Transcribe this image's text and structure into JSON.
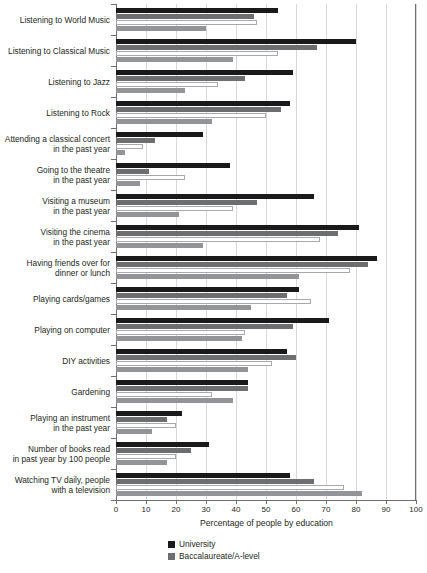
{
  "chart_data": {
    "type": "bar",
    "orientation": "horizontal",
    "title": "",
    "xlabel": "Percentage of people by education",
    "ylabel": "",
    "xlim": [
      0,
      100
    ],
    "xticks": [
      0,
      10,
      20,
      30,
      40,
      50,
      60,
      70,
      80,
      90,
      100
    ],
    "grid": true,
    "legend_position": "bottom",
    "categories": [
      "Listening to World Music",
      "Listening to Classical Music",
      "Listening to Jazz",
      "Listening to Rock",
      "Attending a classical concert\nin the past year",
      "Going to the theatre\nin the past year",
      "Visiting a museum\nin the past year",
      "Visiting the cinema\nin the past year",
      "Having friends over for\ndinner or lunch",
      "Playing cards/games",
      "Playing on computer",
      "DIY activities",
      "Gardening",
      "Playing an instrument\nin the past year",
      "Number of books read\nin past year by 100 people",
      "Watching TV daily, people\nwith a television"
    ],
    "series": [
      {
        "name": "University",
        "color": "#1a1a1a",
        "values": [
          54,
          80,
          59,
          58,
          29,
          38,
          66,
          81,
          87,
          61,
          71,
          57,
          44,
          22,
          31,
          58
        ]
      },
      {
        "name": "Baccalaureate/A-level",
        "color": "#6c6e70",
        "values": [
          46,
          67,
          43,
          55,
          13,
          11,
          47,
          74,
          84,
          57,
          59,
          60,
          44,
          17,
          25,
          66
        ]
      },
      {
        "name": "Vocational qualification",
        "color": "#ffffff",
        "values": [
          47,
          54,
          34,
          50,
          9,
          23,
          39,
          68,
          78,
          65,
          43,
          52,
          32,
          20,
          20,
          76
        ]
      },
      {
        "name": "No qualification",
        "color": "#929497",
        "values": [
          30,
          39,
          23,
          32,
          3,
          8,
          21,
          29,
          61,
          45,
          42,
          44,
          39,
          12,
          17,
          82
        ]
      }
    ]
  },
  "legend": {
    "items": [
      {
        "label": "University",
        "color": "#1a1a1a"
      },
      {
        "label": "Baccalaureate/A-level",
        "color": "#6c6e70"
      }
    ]
  }
}
